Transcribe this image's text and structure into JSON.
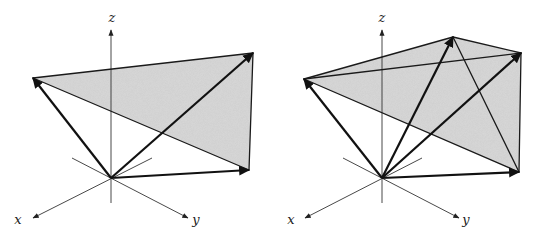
{
  "figure": {
    "width": 545,
    "height": 238,
    "colors": {
      "stroke": "#1a1a1a",
      "axis": "#333333",
      "fill": "#d9d9d9",
      "background": "#ffffff"
    },
    "panels": [
      {
        "id": "left",
        "description": "Three vectors from origin spanning a shaded triangle",
        "origin": [
          111,
          178
        ],
        "axes": {
          "z": {
            "label": "z",
            "tip": [
              111,
              30
            ],
            "tail": [
              111,
              203
            ],
            "label_pos": [
              112,
              22
            ]
          },
          "x": {
            "label": "x",
            "tip": [
              33,
              218
            ],
            "tail": [
              152,
              158
            ],
            "label_pos": [
              18,
              224
            ]
          },
          "y": {
            "label": "y",
            "tip": [
              188,
              218
            ],
            "tail": [
              72,
              158
            ],
            "label_pos": [
              196,
              224
            ]
          }
        },
        "vertices": {
          "A": [
            33,
            78
          ],
          "B": [
            253,
            53
          ],
          "C": [
            249,
            170
          ]
        },
        "faces": [
          [
            "A",
            "B",
            "C"
          ]
        ],
        "edges": [
          [
            "A",
            "B"
          ],
          [
            "B",
            "C"
          ],
          [
            "A",
            "C"
          ]
        ],
        "vectors": [
          "A",
          "B",
          "C"
        ]
      },
      {
        "id": "right",
        "description": "Four vectors from origin spanning a shaded tetrahedron-like surface",
        "origin": [
          382,
          178
        ],
        "axes": {
          "z": {
            "label": "z",
            "tip": [
              382,
              30
            ],
            "tail": [
              382,
              203
            ],
            "label_pos": [
              382,
              22
            ]
          },
          "x": {
            "label": "x",
            "tip": [
              305,
              218
            ],
            "tail": [
              422,
              158
            ],
            "label_pos": [
              291,
              224
            ]
          },
          "y": {
            "label": "y",
            "tip": [
              459,
              218
            ],
            "tail": [
              343,
              158
            ],
            "label_pos": [
              466,
              224
            ]
          }
        },
        "vertices": {
          "A": [
            304,
            79
          ],
          "D": [
            453,
            37
          ],
          "B": [
            521,
            53
          ],
          "C": [
            519,
            172
          ]
        },
        "faces": [
          [
            "A",
            "D",
            "B",
            "C"
          ]
        ],
        "edges": [
          [
            "A",
            "D"
          ],
          [
            "D",
            "B"
          ],
          [
            "A",
            "B"
          ],
          [
            "B",
            "C"
          ],
          [
            "A",
            "C"
          ],
          [
            "D",
            "C"
          ]
        ],
        "vectors": [
          "A",
          "D",
          "B",
          "C"
        ]
      }
    ]
  }
}
